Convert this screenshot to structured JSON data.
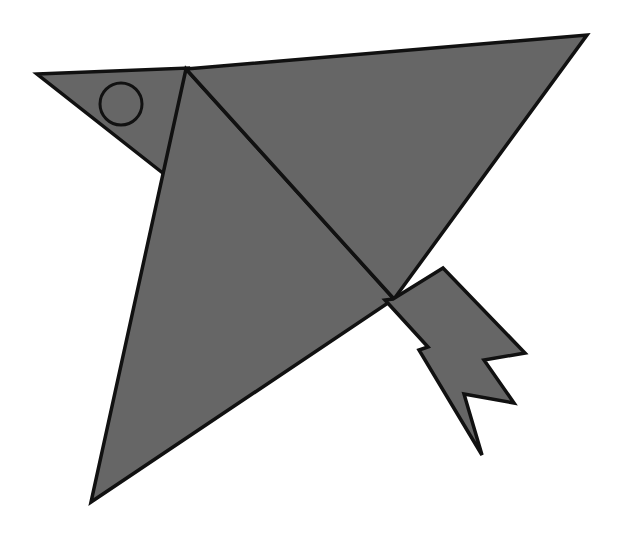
{
  "canvas": {
    "width": 622,
    "height": 534,
    "background_color": "#ffffff",
    "title": "Origami Bird Figure"
  },
  "style": {
    "fill_color": "#666666",
    "stroke_color": "#111111",
    "stroke_width": 3.5,
    "eye_fill_color": "#666666",
    "eye_stroke_color": "#111111",
    "eye_stroke_width": 3
  },
  "figure": {
    "name": "bird",
    "parts": [
      {
        "id": "head",
        "label": "Head and beak triangle",
        "points": "37,74 188,68 164,174"
      },
      {
        "id": "body",
        "label": "Body triangle",
        "points": "186,69 394,299 91,502"
      },
      {
        "id": "wing",
        "label": "Upper wing triangle",
        "points": "186,69 587,35 394,299"
      },
      {
        "id": "tail",
        "label": "Jagged tail feathers",
        "points": "393,299 443,268 525,353 484,360 514,403 464,394 482,455 419,350 428,347 385,300"
      }
    ],
    "eye": {
      "id": "eye",
      "label": "Eye circle",
      "cx": 121,
      "cy": 104,
      "r": 21
    }
  }
}
